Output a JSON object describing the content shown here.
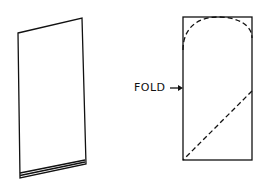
{
  "diagram": {
    "left_figure": {
      "description": "folded sheet of paper, perspective view"
    },
    "right_figure": {
      "description": "rectangle with dashed cutting lines",
      "fold_label": "FOLD",
      "arrow": "right-arrow"
    },
    "colors": {
      "line": "#111111",
      "background": "#ffffff"
    }
  }
}
